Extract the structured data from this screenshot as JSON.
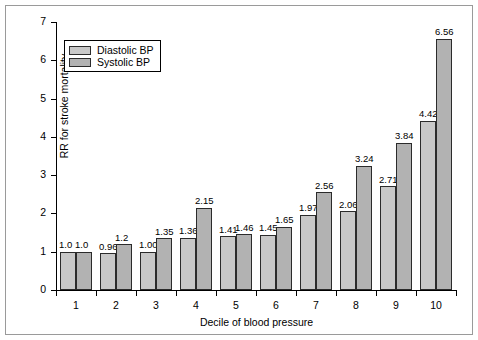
{
  "chart_data": {
    "type": "bar",
    "title": "",
    "xlabel": "Decile of blood pressure",
    "ylabel": "RR for stroke mortality",
    "categories": [
      "1",
      "2",
      "3",
      "4",
      "5",
      "6",
      "7",
      "8",
      "9",
      "10"
    ],
    "ylim": [
      0,
      7
    ],
    "yticks": [
      "0",
      "1",
      "2",
      "3",
      "4",
      "5",
      "6",
      "7"
    ],
    "grid": false,
    "legend_position": "top-left",
    "series": [
      {
        "name": "Diastolic BP",
        "color": "#c8c8c8",
        "values": [
          1.0,
          0.96,
          1.0,
          1.36,
          1.41,
          1.45,
          1.97,
          2.06,
          2.71,
          4.42
        ],
        "labels": [
          "1.0",
          "0.96",
          "1.00",
          "1.36",
          "1.41",
          "1.45",
          "1.97",
          "2.06",
          "2.71",
          "4.42"
        ]
      },
      {
        "name": "Systolic BP",
        "color": "#b2b2b2",
        "values": [
          1.0,
          1.2,
          1.35,
          2.15,
          1.46,
          1.65,
          2.56,
          3.24,
          3.84,
          6.56
        ],
        "labels": [
          "1.0",
          "1.2",
          "1.35",
          "2.15",
          "1.46",
          "1.65",
          "2.56",
          "3.24",
          "3.84",
          "6.56"
        ]
      }
    ]
  },
  "legend": {
    "items": [
      {
        "label": "Diastolic BP"
      },
      {
        "label": "Systolic BP"
      }
    ]
  }
}
